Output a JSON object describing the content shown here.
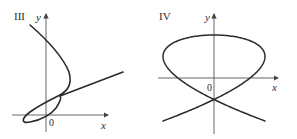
{
  "panels": [
    {
      "id": "III",
      "label": "III",
      "x_axis_label": "x",
      "y_axis_label": "y",
      "origin_label": "0",
      "description": "Parametric curve: descends from upper left, bulges right, loops near origin at lower left, then exits as straight line rising to the right"
    },
    {
      "id": "IV",
      "label": "IV",
      "x_axis_label": "x",
      "y_axis_label": "y",
      "origin_label": "0",
      "description": "Lissajous-type closed curve with multiple self-intersections, symmetric about both axes"
    }
  ],
  "colors": {
    "curve": "#2b2b2b",
    "axis": "#555555",
    "background": "#ffffff"
  }
}
